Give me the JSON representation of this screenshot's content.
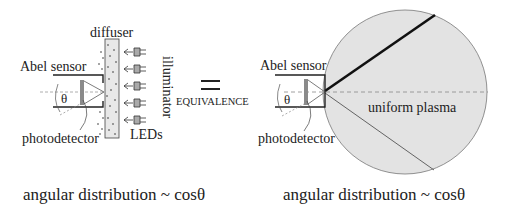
{
  "left_panel": {
    "diffuser_label": "diffuser",
    "sensor_label": "Abel sensor",
    "theta_label": "θ",
    "photodetector_label": "photodetector",
    "illuminator_label": "illuminator",
    "leds_label": "LEDs",
    "led_count": 5,
    "caption": "angular distribution ~ cosθ"
  },
  "middle": {
    "equals_symbol": "=",
    "equivalence_label": "EQUIVALENCE"
  },
  "right_panel": {
    "sensor_label": "Abel sensor",
    "theta_label": "θ",
    "photodetector_label": "photodetector",
    "plasma_label": "uniform plasma",
    "caption": "angular distribution ~ cosθ"
  },
  "colors": {
    "plasma_fill": "#e3e3e3",
    "diffuser_fill": "#e8e8e8",
    "photodetector_fill": "#8a8a8a",
    "line": "#222222",
    "dashed": "#888888"
  }
}
